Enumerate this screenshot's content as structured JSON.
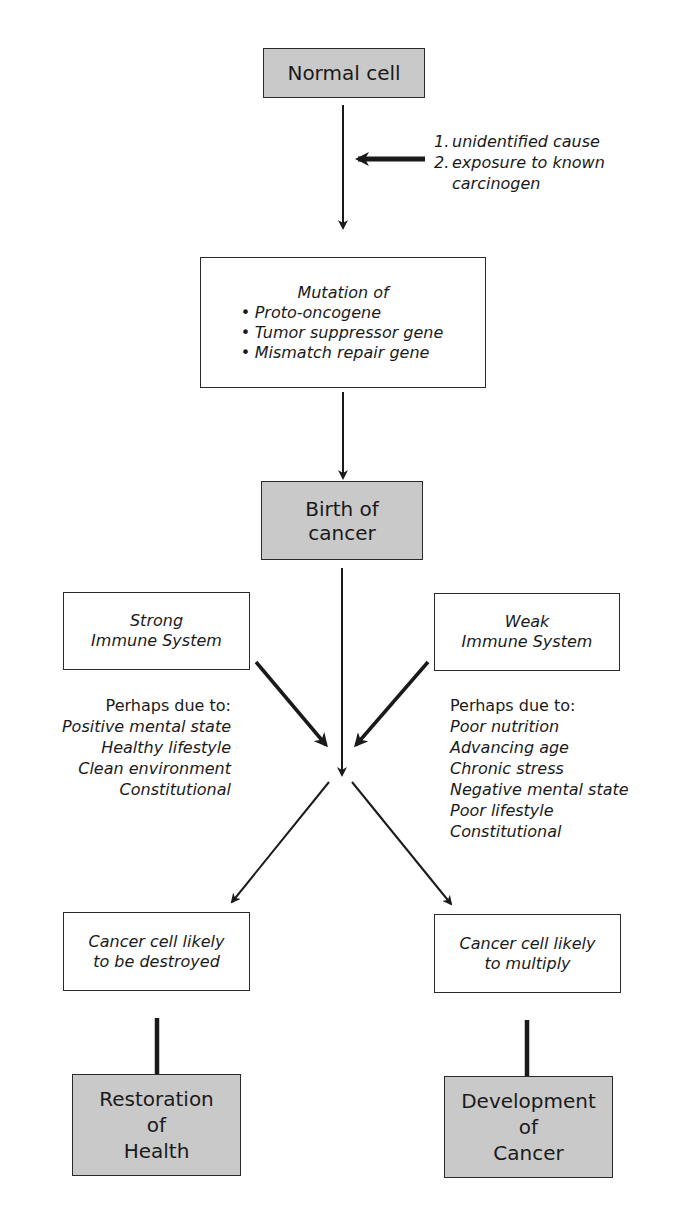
{
  "diagram": {
    "nodes": {
      "normal_cell": {
        "label": "Normal cell"
      },
      "causes": {
        "items": [
          {
            "num": "1.",
            "text": "unidentified cause"
          },
          {
            "num": "2.",
            "text": "exposure to known"
          }
        ],
        "continuation": "carcinogen"
      },
      "mutation": {
        "title": "Mutation of",
        "items": [
          "Proto-oncogene",
          "Tumor suppressor gene",
          "Mismatch repair gene"
        ]
      },
      "birth_of_cancer": {
        "line1": "Birth of",
        "line2": "cancer"
      },
      "strong_immune": {
        "line1": "Strong",
        "line2": "Immune System"
      },
      "weak_immune": {
        "line1": "Weak",
        "line2": "Immune System"
      },
      "strong_factors": {
        "heading": "Perhaps due to:",
        "items": [
          "Positive mental state",
          "Healthy lifestyle",
          "Clean environment",
          "Constitutional"
        ]
      },
      "weak_factors": {
        "heading": "Perhaps due to:",
        "items": [
          "Poor nutrition",
          "Advancing age",
          "Chronic stress",
          "Negative mental state",
          "Poor lifestyle",
          "Constitutional"
        ]
      },
      "destroyed": {
        "line1": "Cancer cell likely",
        "line2": "to be destroyed"
      },
      "multiply": {
        "line1": "Cancer cell likely",
        "line2": "to multiply"
      },
      "restoration": {
        "line1": "Restoration",
        "line2": "of",
        "line3": "Health"
      },
      "development": {
        "line1": "Development",
        "line2": "of",
        "line3": "Cancer"
      }
    },
    "colors": {
      "shaded_box": "#c9c9c9",
      "line": "#1a1a1a"
    }
  }
}
